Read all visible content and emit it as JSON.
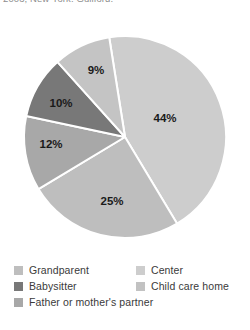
{
  "citation": {
    "text": "2003, New York: Guilford.",
    "edge_marks": "· ·"
  },
  "chart_data": {
    "type": "pie",
    "title": "",
    "subtitle": "",
    "xlabel": "",
    "ylabel": "",
    "legend_position": "bottom",
    "grid": false,
    "unit": "%",
    "categories": [
      "Center",
      "Grandparent",
      "Child care home",
      "Babysitter",
      "Father or mother's partner"
    ],
    "values": [
      44,
      25,
      12,
      10,
      9
    ],
    "labels": [
      "44%",
      "25%",
      "12%",
      "10%",
      "9%"
    ],
    "colors": [
      "#cdcdcd",
      "#bebebe",
      "#a8a8a8",
      "#787878",
      "#c4c4c4"
    ],
    "slices": [
      {
        "name": "Center",
        "value": 44,
        "label": "44%",
        "color": "#cdcdcd",
        "start_angle": -9,
        "end_angle": 149,
        "label_x": 165,
        "label_y": 105
      },
      {
        "name": "Grandparent",
        "value": 25,
        "label": "25%",
        "color": "#bebebe",
        "start_angle": 149,
        "end_angle": 239,
        "label_x": 112,
        "label_y": 188
      },
      {
        "name": "Child care home",
        "value": 12,
        "label": "12%",
        "color": "#a8a8a8",
        "start_angle": 239,
        "end_angle": 282,
        "label_x": 51,
        "label_y": 131
      },
      {
        "name": "Babysitter",
        "value": 10,
        "label": "10%",
        "color": "#787878",
        "start_angle": 282,
        "end_angle": 318,
        "label_x": 61,
        "label_y": 90
      },
      {
        "name": "Father or mother's partner",
        "value": 9,
        "label": "9%",
        "color": "#c4c4c4",
        "start_angle": 318,
        "end_angle": 351,
        "label_x": 96,
        "label_y": 57
      }
    ],
    "geometry": {
      "center_x": 125,
      "center_y": 123,
      "radius": 101,
      "separator_color": "#ffffff",
      "separator_width": 2
    }
  },
  "legend": {
    "rows": [
      {
        "left": {
          "label": "Grandparent",
          "color": "#bebebe"
        },
        "right": {
          "label": "Center",
          "color": "#cdcdcd"
        }
      },
      {
        "left": {
          "label": "Babysitter",
          "color": "#787878"
        },
        "right": {
          "label": "Child care home",
          "color": "#c2c2c2"
        }
      },
      {
        "left": {
          "label": "Father or mother's partner",
          "color": "#a8a8a8"
        },
        "right": null
      }
    ]
  }
}
